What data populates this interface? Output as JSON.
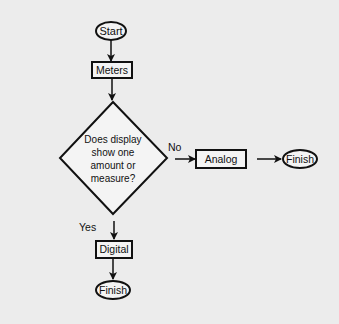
{
  "diagram": {
    "type": "flowchart",
    "colors": {
      "background": "#ececec",
      "stroke": "#111111",
      "node_fill": "#f4f4f4"
    },
    "nodes": {
      "start": {
        "shape": "oval",
        "label": "Start"
      },
      "meters": {
        "shape": "rectangle",
        "label": "Meters"
      },
      "decision": {
        "shape": "diamond",
        "lines": [
          "Does display",
          "show one",
          "amount or",
          "measure?"
        ]
      },
      "analog": {
        "shape": "rectangle",
        "label": "Analog"
      },
      "finish_right": {
        "shape": "oval",
        "label": "Finish"
      },
      "digital": {
        "shape": "rectangle",
        "label": "Digital"
      },
      "finish_bottom": {
        "shape": "oval",
        "label": "Finish"
      }
    },
    "edges": [
      {
        "from": "start",
        "to": "meters",
        "label": ""
      },
      {
        "from": "meters",
        "to": "decision",
        "label": ""
      },
      {
        "from": "decision",
        "to": "analog",
        "label": "No"
      },
      {
        "from": "analog",
        "to": "finish_right",
        "label": ""
      },
      {
        "from": "decision",
        "to": "digital",
        "label": "Yes"
      },
      {
        "from": "digital",
        "to": "finish_bottom",
        "label": ""
      }
    ],
    "edge_labels": {
      "no": "No",
      "yes": "Yes"
    }
  }
}
